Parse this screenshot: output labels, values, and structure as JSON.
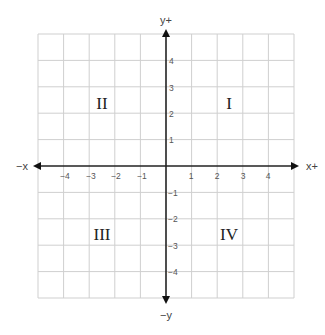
{
  "diagram": {
    "grid": {
      "x_min": -5,
      "x_max": 5,
      "y_min": -5,
      "y_max": 5,
      "color": "#cccccc"
    },
    "axis_color": "#222222",
    "axis_labels": {
      "x_positive": "x+",
      "x_negative": "−x",
      "y_positive": "y+",
      "y_negative": "−y"
    },
    "x_ticks": [
      "−4",
      "−3",
      "−2",
      "−1",
      "1",
      "2",
      "3",
      "4"
    ],
    "y_ticks": [
      "4",
      "3",
      "2",
      "1",
      "−1",
      "−2",
      "−3",
      "−4"
    ],
    "quadrants": {
      "I": "I",
      "II": "II",
      "III": "III",
      "IV": "IV"
    }
  }
}
